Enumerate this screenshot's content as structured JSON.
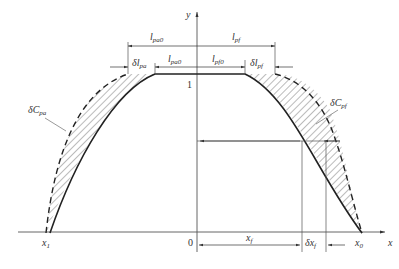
{
  "diagram": {
    "axes": {
      "x_label": "x",
      "y_label": "y",
      "origin_label": "0",
      "y_tick_label": "1"
    },
    "x_points": {
      "x1": {
        "base": "x",
        "sub": "1"
      },
      "x0": {
        "base": "x",
        "sub": "0"
      },
      "xf": {
        "base": "x",
        "sub": "f"
      },
      "dxf": {
        "base": "δx",
        "sub": "f"
      }
    },
    "dimensions": {
      "l_pa0_outer": {
        "base": "l",
        "sub": "pa0"
      },
      "l_pf_outer": {
        "base": "l",
        "sub": "pf"
      },
      "l_pa0_inner": {
        "base": "l",
        "sub": "pa0"
      },
      "l_pf0_inner": {
        "base": "l",
        "sub": "pf0"
      },
      "dl_pa": {
        "base": "δl",
        "sub": "pa"
      },
      "dl_pf": {
        "base": "δl",
        "sub": "pf"
      }
    },
    "curve_labels": {
      "dC_pa": {
        "base": "δC",
        "sub": "pa"
      },
      "dC_pf": {
        "base": "δC",
        "sub": "pf"
      }
    },
    "colors": {
      "line": "#333333",
      "axis": "#555555"
    }
  }
}
